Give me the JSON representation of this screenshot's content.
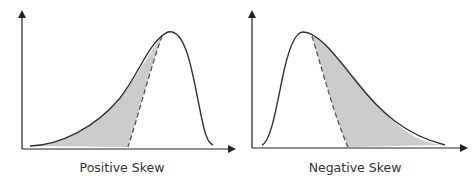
{
  "colors": {
    "curve": "#333333",
    "axis": "#222222",
    "shade": "#cccccc",
    "dashed": "#555555",
    "background": "#ffffff"
  },
  "charts": [
    {
      "id": "positive-skew",
      "label": "Positive Skew",
      "peak": [
        168,
        32
      ],
      "shaded_region": "left of mode, bounded by dashed line"
    },
    {
      "id": "negative-skew",
      "label": "Negative Skew",
      "peak": [
        303,
        32
      ],
      "shaded_region": "right of mode, bounded by dashed line"
    }
  ]
}
